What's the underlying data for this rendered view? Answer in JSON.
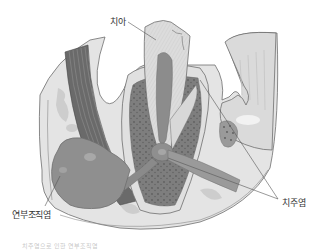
{
  "diagram": {
    "labels": {
      "tooth": "치아",
      "soft_tissue_inflammation": "연부조직염",
      "periodontitis": "치주염"
    },
    "caption": "치주염으로 인한 연부조직염",
    "colors": {
      "background": "#ffffff",
      "outline": "#6e6e6e",
      "gum_tissue": "#e6e6e6",
      "tissue_light": "#d2d2d2",
      "tooth_enamel": "#dcdcdc",
      "pulp": "#8c8c8c",
      "bone": "#7a7a7a",
      "abscess": "#8f8f8f",
      "muscle_band": "#5a5a5a",
      "label_text": "#333333"
    }
  }
}
